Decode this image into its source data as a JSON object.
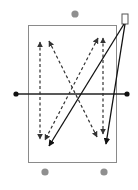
{
  "diagram": {
    "type": "drill-diagram",
    "field": {
      "x": 28.5,
      "y": 25.5,
      "width": 88,
      "height": 137,
      "stroke": "#8a8a8a"
    },
    "midline": {
      "x1": 16,
      "y1": 94,
      "x2": 127,
      "y2": 94,
      "stroke": "#222222"
    },
    "midline_endpoints": [
      {
        "name": "left-post",
        "cx": 16,
        "cy": 94,
        "r": 2.6,
        "fill": "#111111"
      },
      {
        "name": "right-post",
        "cx": 127,
        "cy": 94,
        "r": 2.6,
        "fill": "#111111"
      }
    ],
    "players": [
      {
        "name": "player-top",
        "cx": 75,
        "cy": 14,
        "r": 3.6,
        "fill": "#8f8f8f"
      },
      {
        "name": "player-bottom-left",
        "cx": 45,
        "cy": 172,
        "r": 3.6,
        "fill": "#8f8f8f"
      },
      {
        "name": "player-bottom-right",
        "cx": 104,
        "cy": 172,
        "r": 3.6,
        "fill": "#8f8f8f"
      }
    ],
    "coach_marker": {
      "x": 122,
      "y": 14,
      "width": 6,
      "height": 10,
      "stroke": "#555555"
    },
    "dashed_runs": [
      {
        "name": "run-left-vertical",
        "x1": 40,
        "y1": 42,
        "x2": 40,
        "y2": 139,
        "both_heads": true
      },
      {
        "name": "run-left-diagonal",
        "x1": 49,
        "y1": 41,
        "x2": 97,
        "y2": 137,
        "both_heads": true
      },
      {
        "name": "run-right-vertical",
        "x1": 103,
        "y1": 38,
        "x2": 103,
        "y2": 134,
        "both_heads": true
      },
      {
        "name": "run-right-diagonal",
        "x1": 98,
        "y1": 38,
        "x2": 45,
        "y2": 140,
        "both_heads": true
      }
    ],
    "solid_passes": [
      {
        "name": "pass-to-bottom-left",
        "x1": 124,
        "y1": 24,
        "x2": 49,
        "y2": 146
      },
      {
        "name": "pass-to-bottom-right",
        "x1": 125,
        "y1": 24,
        "x2": 106,
        "y2": 144
      }
    ],
    "colors": {
      "dashed": "#333333",
      "solid": "#111111"
    }
  }
}
